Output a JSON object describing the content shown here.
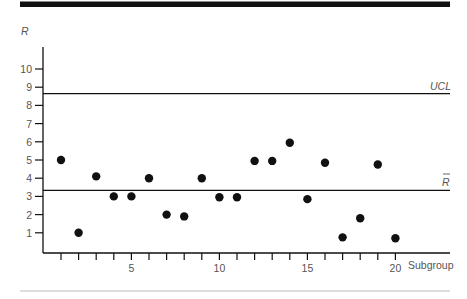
{
  "chart_data": {
    "type": "scatter",
    "title": "",
    "xlabel": "Subgroup",
    "ylabel": "R",
    "x": [
      1,
      2,
      3,
      4,
      5,
      6,
      7,
      8,
      9,
      10,
      11,
      12,
      13,
      14,
      15,
      16,
      17,
      18,
      19,
      20
    ],
    "series": [
      {
        "name": "R",
        "values": [
          5.0,
          1.0,
          4.1,
          3.0,
          3.0,
          4.0,
          2.0,
          1.9,
          4.0,
          2.95,
          2.95,
          4.95,
          4.95,
          5.95,
          2.85,
          4.85,
          0.75,
          1.8,
          4.75,
          0.7
        ]
      }
    ],
    "reference_lines": [
      {
        "name": "UCL",
        "label": "UCL",
        "value": 8.65
      },
      {
        "name": "R-bar",
        "label": "R̄",
        "value": 3.33
      }
    ],
    "xticks": [
      1,
      2,
      3,
      4,
      5,
      6,
      7,
      8,
      9,
      10,
      11,
      12,
      13,
      14,
      15,
      16,
      17,
      18,
      19,
      20
    ],
    "xtick_labels": [
      "5",
      "10",
      "15",
      "20"
    ],
    "xtick_label_values": [
      5,
      10,
      15,
      20
    ],
    "yticks": [
      1,
      2,
      3,
      4,
      5,
      6,
      7,
      8,
      9,
      10
    ],
    "ytick_labels": [
      "1",
      "2",
      "3",
      "4",
      "5",
      "6",
      "7",
      "8",
      "9",
      "10"
    ],
    "ylim": [
      0,
      10.9
    ],
    "xlim": [
      0,
      21
    ],
    "grid": false,
    "legend": "none"
  },
  "labels": {
    "y_axis": "R",
    "x_axis": "Subgroup",
    "ucl": "UCL",
    "rbar": "R"
  },
  "colors": {
    "ink": "#111111",
    "text": "#555555",
    "rule_top": "#111111",
    "rule_bottom": "#bbbbbb"
  }
}
